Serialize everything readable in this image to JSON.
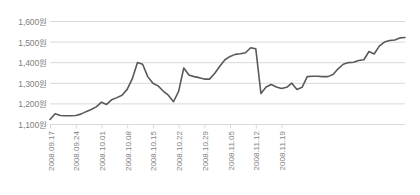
{
  "chart_data": {
    "type": "line",
    "title": "",
    "subtitle": "",
    "xlabel": "",
    "ylabel": "",
    "currency_suffix": "원",
    "grid": true,
    "legend": "none",
    "ylim": [
      1100,
      1600
    ],
    "y_ticks": [
      1100,
      1200,
      1300,
      1400,
      1500,
      1600
    ],
    "y_tick_labels": [
      "1,100원",
      "1,200원",
      "1,300원",
      "1,400원",
      "1,500원",
      "1,600원"
    ],
    "x_tick_labels": [
      "2008.09.17",
      "2008.09.24",
      "2008.10.01",
      "2008.10.08",
      "2008.10.15",
      "2008.10.22",
      "2008.10.29",
      "2008.11.05",
      "2008.11.12",
      "2008.11.19"
    ],
    "x_tick_indices": [
      0,
      5,
      10,
      15,
      20,
      25,
      30,
      35,
      40,
      45
    ],
    "series": [
      {
        "name": "환율",
        "color": "#595959",
        "values": [
          1122,
          1150,
          1141,
          1140,
          1140,
          1141,
          1148,
          1160,
          1170,
          1183,
          1206,
          1195,
          1218,
          1228,
          1240,
          1268,
          1320,
          1398,
          1390,
          1330,
          1298,
          1285,
          1260,
          1240,
          1208,
          1258,
          1372,
          1338,
          1330,
          1325,
          1318,
          1318,
          1345,
          1380,
          1412,
          1428,
          1438,
          1441,
          1446,
          1470,
          1465,
          1248,
          1280,
          1292,
          1280,
          1272,
          1278,
          1298,
          1268,
          1278,
          1330,
          1332,
          1332,
          1330,
          1330,
          1340,
          1368,
          1390,
          1398,
          1400,
          1408,
          1412,
          1452,
          1440,
          1478,
          1498,
          1505,
          1508,
          1518,
          1520
        ]
      }
    ]
  }
}
